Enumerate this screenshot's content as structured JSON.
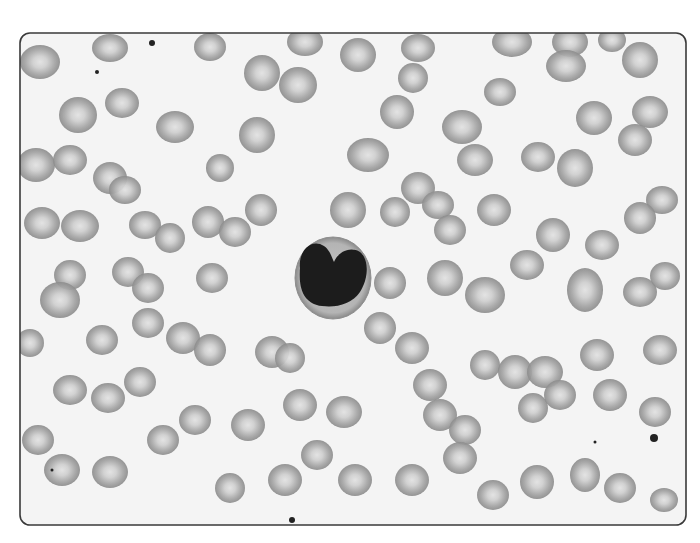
{
  "image": {
    "subject": "Peripheral blood smear micrograph (grayscale)",
    "frame": {
      "x": 20,
      "y": 33,
      "width": 666,
      "height": 492,
      "radius": 10,
      "border_color": "#3a3a3a",
      "background": "#f4f4f4"
    },
    "colors": {
      "rbc_edge": "#8e8e8e",
      "rbc_center": "#d8d8d8",
      "nucleus": "#1c1c1c",
      "cytoplasm": "#b9b9b9",
      "dust": "#222222"
    },
    "wbc": {
      "cx": 333,
      "cy": 278,
      "r": 40
    },
    "rbcs": [
      [
        40,
        62,
        20,
        17
      ],
      [
        110,
        48,
        18,
        14
      ],
      [
        210,
        47,
        16,
        14
      ],
      [
        305,
        42,
        18,
        14
      ],
      [
        358,
        55,
        18,
        17
      ],
      [
        418,
        48,
        17,
        14
      ],
      [
        512,
        42,
        20,
        15
      ],
      [
        570,
        42,
        18,
        15
      ],
      [
        612,
        40,
        14,
        12
      ],
      [
        640,
        60,
        18,
        18
      ],
      [
        78,
        115,
        19,
        18
      ],
      [
        122,
        103,
        17,
        15
      ],
      [
        175,
        127,
        19,
        16
      ],
      [
        262,
        73,
        18,
        18
      ],
      [
        298,
        85,
        19,
        18
      ],
      [
        397,
        112,
        17,
        17
      ],
      [
        413,
        78,
        15,
        15
      ],
      [
        462,
        127,
        20,
        17
      ],
      [
        500,
        92,
        16,
        14
      ],
      [
        566,
        66,
        20,
        16
      ],
      [
        594,
        118,
        18,
        17
      ],
      [
        650,
        112,
        18,
        16
      ],
      [
        36,
        165,
        19,
        17
      ],
      [
        70,
        160,
        17,
        15
      ],
      [
        110,
        178,
        17,
        16
      ],
      [
        125,
        190,
        16,
        14
      ],
      [
        220,
        168,
        14,
        14
      ],
      [
        257,
        135,
        18,
        18
      ],
      [
        368,
        155,
        21,
        17
      ],
      [
        418,
        188,
        17,
        16
      ],
      [
        438,
        205,
        16,
        14
      ],
      [
        475,
        160,
        18,
        16
      ],
      [
        538,
        157,
        17,
        15
      ],
      [
        575,
        168,
        18,
        19
      ],
      [
        635,
        140,
        17,
        16
      ],
      [
        662,
        200,
        16,
        14
      ],
      [
        42,
        223,
        18,
        16
      ],
      [
        80,
        226,
        19,
        16
      ],
      [
        145,
        225,
        16,
        14
      ],
      [
        170,
        238,
        15,
        15
      ],
      [
        208,
        222,
        16,
        16
      ],
      [
        235,
        232,
        16,
        15
      ],
      [
        261,
        210,
        16,
        16
      ],
      [
        348,
        210,
        18,
        18
      ],
      [
        395,
        212,
        15,
        15
      ],
      [
        450,
        230,
        16,
        15
      ],
      [
        494,
        210,
        17,
        16
      ],
      [
        553,
        235,
        17,
        17
      ],
      [
        602,
        245,
        17,
        15
      ],
      [
        640,
        218,
        16,
        16
      ],
      [
        70,
        275,
        16,
        15
      ],
      [
        60,
        300,
        20,
        18
      ],
      [
        128,
        272,
        16,
        15
      ],
      [
        148,
        288,
        16,
        15
      ],
      [
        212,
        278,
        16,
        15
      ],
      [
        390,
        283,
        16,
        16
      ],
      [
        445,
        278,
        18,
        18
      ],
      [
        485,
        295,
        20,
        18
      ],
      [
        527,
        265,
        17,
        15
      ],
      [
        585,
        290,
        18,
        22
      ],
      [
        640,
        292,
        17,
        15
      ],
      [
        665,
        276,
        15,
        14
      ],
      [
        30,
        343,
        14,
        14
      ],
      [
        102,
        340,
        16,
        15
      ],
      [
        148,
        323,
        16,
        15
      ],
      [
        183,
        338,
        17,
        16
      ],
      [
        210,
        350,
        16,
        16
      ],
      [
        272,
        352,
        17,
        16
      ],
      [
        290,
        358,
        15,
        15
      ],
      [
        380,
        328,
        16,
        16
      ],
      [
        412,
        348,
        17,
        16
      ],
      [
        485,
        365,
        15,
        15
      ],
      [
        515,
        372,
        17,
        17
      ],
      [
        545,
        372,
        18,
        16
      ],
      [
        597,
        355,
        17,
        16
      ],
      [
        660,
        350,
        17,
        15
      ],
      [
        70,
        390,
        17,
        15
      ],
      [
        108,
        398,
        17,
        15
      ],
      [
        140,
        382,
        16,
        15
      ],
      [
        195,
        420,
        16,
        15
      ],
      [
        248,
        425,
        17,
        16
      ],
      [
        300,
        405,
        17,
        16
      ],
      [
        344,
        412,
        18,
        16
      ],
      [
        430,
        385,
        17,
        16
      ],
      [
        440,
        415,
        17,
        16
      ],
      [
        465,
        430,
        16,
        15
      ],
      [
        533,
        408,
        15,
        15
      ],
      [
        560,
        395,
        16,
        15
      ],
      [
        610,
        395,
        17,
        16
      ],
      [
        655,
        412,
        16,
        15
      ],
      [
        38,
        440,
        16,
        15
      ],
      [
        62,
        470,
        18,
        16
      ],
      [
        110,
        472,
        18,
        16
      ],
      [
        163,
        440,
        16,
        15
      ],
      [
        230,
        488,
        15,
        15
      ],
      [
        285,
        480,
        17,
        16
      ],
      [
        317,
        455,
        16,
        15
      ],
      [
        355,
        480,
        17,
        16
      ],
      [
        412,
        480,
        17,
        16
      ],
      [
        460,
        458,
        17,
        16
      ],
      [
        493,
        495,
        16,
        15
      ],
      [
        537,
        482,
        17,
        17
      ],
      [
        585,
        475,
        15,
        17
      ],
      [
        620,
        488,
        16,
        15
      ],
      [
        664,
        500,
        14,
        12
      ]
    ],
    "dust": [
      [
        152,
        43,
        3
      ],
      [
        654,
        438,
        4
      ],
      [
        97,
        72,
        2
      ],
      [
        292,
        520,
        3
      ],
      [
        52,
        470,
        1.5
      ],
      [
        595,
        442,
        1.5
      ]
    ]
  }
}
